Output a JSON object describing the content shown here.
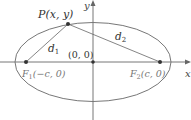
{
  "diagram": {
    "type": "ellipse-foci",
    "axes": {
      "x_label": "x",
      "y_label": "y"
    },
    "origin_label": "(0, 0)",
    "point": {
      "label": "P(x, y)"
    },
    "focus1": {
      "label": "F₁(−c, 0)",
      "name": "F",
      "sub": "1",
      "coords": "(−c, 0)"
    },
    "focus2": {
      "label": "F₂(c, 0)",
      "name": "F",
      "sub": "2",
      "coords": "(c, 0)"
    },
    "distances": [
      {
        "name": "d",
        "sub": "1"
      },
      {
        "name": "d",
        "sub": "2"
      }
    ],
    "colors": {
      "stroke": "#555555",
      "point": "#333333",
      "focus_text": "#777777"
    }
  }
}
